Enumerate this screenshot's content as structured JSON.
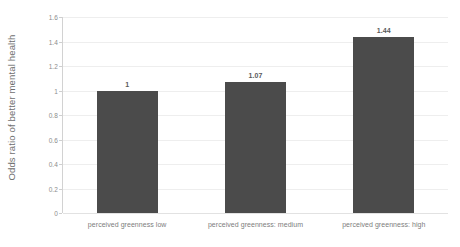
{
  "chart_data": {
    "type": "bar",
    "title": "",
    "subtitle": "",
    "xlabel": "",
    "ylabel": "Odds ratio of better mental health",
    "categories": [
      "perceived greenness low",
      "perceived greenness: medium",
      "perceived greenness: high"
    ],
    "values": [
      1,
      1.07,
      1.44
    ],
    "value_labels": [
      "1",
      "1.07",
      "1.44"
    ],
    "ylim": [
      0,
      1.6
    ],
    "ytick_labels": [
      "0",
      "0.2",
      "0.4",
      "0.6",
      "0.8",
      "1",
      "1.2",
      "1.4",
      "1.6"
    ],
    "ytick_values": [
      0,
      0.2,
      0.4,
      0.6,
      0.8,
      1,
      1.2,
      1.4,
      1.6
    ],
    "grid": "horizontal",
    "legend": "none",
    "series": [
      {
        "name": "Odds ratio of better mental health",
        "values": [
          1,
          1.07,
          1.44
        ]
      }
    ],
    "colors": {
      "bar": "#4b4b4b",
      "gridline": "#eeeeee",
      "axis": "#d2d2d2",
      "text": "#7a7a7a",
      "background": "#ffffff"
    }
  }
}
